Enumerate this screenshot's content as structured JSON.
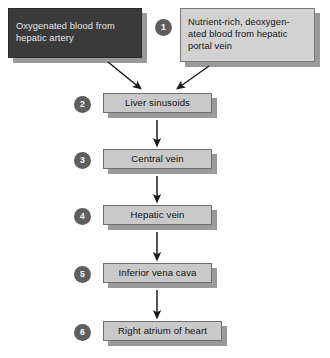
{
  "diagram": {
    "background_color": "#ffffff",
    "sources": [
      {
        "id": "oxygenated",
        "label": "Oxygenated blood from\nhepatic artery",
        "fill": "#3a3a3a",
        "text_color": "#e8e8e8",
        "step": null
      },
      {
        "id": "nutrient-rich",
        "label": "Nutrient-rich, deoxygen-\nated blood from hepatic\nportal vein",
        "fill": "#d2d2d2",
        "text_color": "#141414",
        "step": "1"
      }
    ],
    "chain": [
      {
        "step": "2",
        "label": "Liver sinusoids"
      },
      {
        "step": "3",
        "label": "Central vein"
      },
      {
        "step": "4",
        "label": "Hepatic vein"
      },
      {
        "step": "5",
        "label": "Inferior vena cava"
      },
      {
        "step": "6",
        "label": "Right atrium of heart"
      }
    ],
    "colors": {
      "box_fill": "#c9c9c9",
      "box_border": "#6e6e6e",
      "circle_fill": "#5e5e5e",
      "circle_text": "#ffffff",
      "shadow": "#9a9a9a",
      "arrow": "#1a1a1a"
    }
  }
}
